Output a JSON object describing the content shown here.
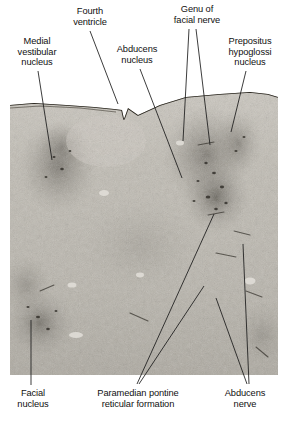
{
  "figure": {
    "type": "histology-photomicrograph",
    "background_color": "#ffffff",
    "leader_line_color": "#1a1a1a"
  },
  "photo": {
    "x": 10,
    "y": 85,
    "width": 268,
    "height": 290,
    "base_color": "#b9b5ad",
    "description": "Grayscale Nissl-stained brainstem section; dark speckled neuronal clusters on a pale fibrous background, with a dark pial surface line across the top forming the floor of the fourth ventricle and a midline notch."
  },
  "labels": [
    {
      "id": "medial-vestibular-nucleus",
      "text": "Medial\nvestibular\nnucleus",
      "x": 2,
      "y": 36,
      "width": 70,
      "leader": [
        {
          "x1": 38,
          "y1": 71,
          "x2": 52,
          "y2": 160
        }
      ]
    },
    {
      "id": "fourth-ventricle",
      "text": "Fourth\nventricle",
      "x": 58,
      "y": 6,
      "width": 64,
      "leader": [
        {
          "x1": 90,
          "y1": 31,
          "x2": 118,
          "y2": 104
        }
      ]
    },
    {
      "id": "abducens-nucleus",
      "text": "Abducens\nnucleus",
      "x": 104,
      "y": 44,
      "width": 66,
      "leader": [
        {
          "x1": 140,
          "y1": 69,
          "x2": 182,
          "y2": 178
        }
      ]
    },
    {
      "id": "genu-of-facial-nerve",
      "text": "Genu of\nfacial nerve",
      "x": 160,
      "y": 4,
      "width": 74,
      "leader": [
        {
          "x1": 189,
          "y1": 29,
          "x2": 183,
          "y2": 141
        },
        {
          "x1": 196,
          "y1": 29,
          "x2": 210,
          "y2": 145
        }
      ]
    },
    {
      "id": "prepositus-hypoglossi-nucleus",
      "text": "Prepositus\nhypoglossi\nnucleus",
      "x": 216,
      "y": 36,
      "width": 68,
      "leader": [
        {
          "x1": 246,
          "y1": 71,
          "x2": 231,
          "y2": 132
        }
      ]
    },
    {
      "id": "facial-nucleus",
      "text": "Facial\nnucleus",
      "x": 2,
      "y": 388,
      "width": 62,
      "leader": [
        {
          "x1": 31,
          "y1": 385,
          "x2": 31,
          "y2": 320
        }
      ]
    },
    {
      "id": "paramedian-pontine-reticular-formation",
      "text": "Paramedian pontine\nreticular formation",
      "x": 76,
      "y": 388,
      "width": 124,
      "leader": [
        {
          "x1": 137,
          "y1": 384,
          "x2": 214,
          "y2": 214
        },
        {
          "x1": 139,
          "y1": 384,
          "x2": 204,
          "y2": 286
        }
      ]
    },
    {
      "id": "abducens-nerve",
      "text": "Abducens\nnerve",
      "x": 212,
      "y": 388,
      "width": 66,
      "leader": [
        {
          "x1": 247,
          "y1": 384,
          "x2": 216,
          "y2": 298
        },
        {
          "x1": 249,
          "y1": 384,
          "x2": 243,
          "y2": 244
        }
      ]
    }
  ]
}
